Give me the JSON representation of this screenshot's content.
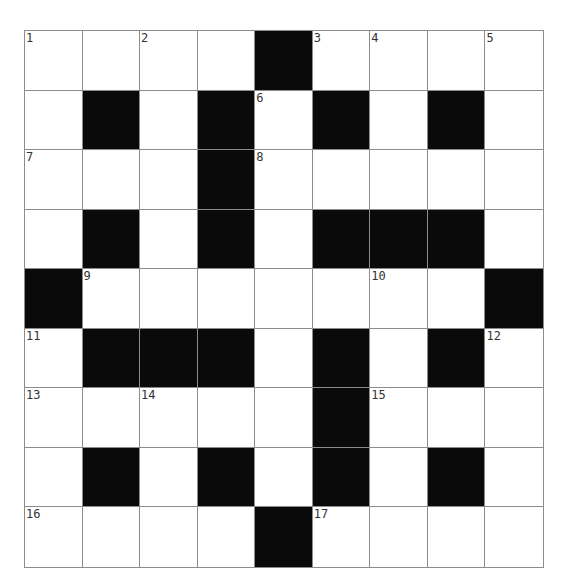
{
  "puzzle": {
    "rows": 9,
    "cols": 9,
    "colors": {
      "block": "#0a0a0a",
      "empty": "#ffffff",
      "gridline": "#8c8c8c"
    },
    "layout": [
      [
        "1",
        ".",
        "2",
        ".",
        "#",
        "3",
        "4",
        ".",
        "5"
      ],
      [
        ".",
        "#",
        ".",
        "#",
        "6",
        "#",
        ".",
        "#",
        "."
      ],
      [
        "7",
        ".",
        ".",
        "#",
        "8",
        ".",
        ".",
        ".",
        "."
      ],
      [
        ".",
        "#",
        ".",
        "#",
        ".",
        "#",
        "#",
        "#",
        "."
      ],
      [
        "#",
        "9",
        ".",
        ".",
        ".",
        ".",
        "10",
        ".",
        "#"
      ],
      [
        "11",
        "#",
        "#",
        "#",
        ".",
        "#",
        ".",
        "#",
        "12"
      ],
      [
        "13",
        ".",
        "14",
        ".",
        ".",
        "#",
        "15",
        ".",
        "."
      ],
      [
        ".",
        "#",
        ".",
        "#",
        ".",
        "#",
        ".",
        "#",
        "."
      ],
      [
        "16",
        ".",
        ".",
        ".",
        "#",
        "17",
        ".",
        ".",
        "."
      ]
    ]
  }
}
